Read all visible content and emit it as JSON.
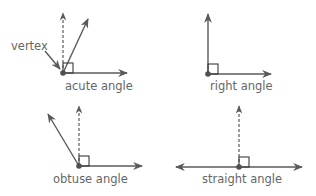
{
  "diagram": {
    "colors": {
      "stroke": "#5a5a5a",
      "square": "#3a3a3a",
      "vertex_dot": "#505050",
      "text": "#666666",
      "background": "#ffffff"
    },
    "callout": {
      "label": "vertex"
    },
    "angles": [
      {
        "id": "acute",
        "label": "acute angle"
      },
      {
        "id": "right",
        "label": "right angle"
      },
      {
        "id": "obtuse",
        "label": "obtuse angle"
      },
      {
        "id": "straight",
        "label": "straight angle"
      }
    ]
  }
}
